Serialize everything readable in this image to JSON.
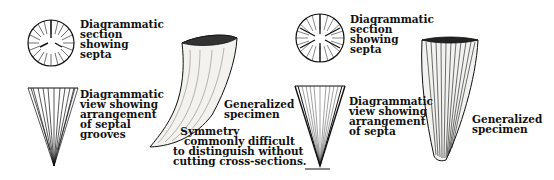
{
  "left_group": {
    "section_label": "Diagrammatic\nsection\nshowing\nsepta",
    "view_label": "Diagrammatic\nview showing\narrangement\nof septal\ngrooves",
    "specimen_label": "Generalized\nspecimen",
    "note_label": "  Symmetry\n   commonly difficult\nto distinguish without\ncutting cross-sections."
  },
  "right_group": {
    "section_label": "Diagrammatic\nsection\nshowing\nsepta",
    "view_label": "Diagrammatic\nview showing\narrangement\nof septa",
    "specimen_label": "Generalized\nspecimen"
  }
}
